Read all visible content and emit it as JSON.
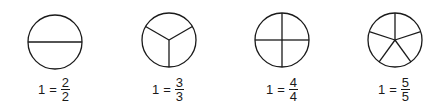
{
  "figures": [
    {
      "parts": 2,
      "cx": 55,
      "cy": 42,
      "r": 27,
      "label": {
        "whole": "1",
        "eq": "=",
        "num": "2",
        "den": "2"
      },
      "label_left": 38
    },
    {
      "parts": 3,
      "cx": 169,
      "cy": 40,
      "r": 27,
      "label": {
        "whole": "1",
        "eq": "=",
        "num": "3",
        "den": "3"
      },
      "label_left": 152
    },
    {
      "parts": 4,
      "cx": 282,
      "cy": 40,
      "r": 27,
      "label": {
        "whole": "1",
        "eq": "=",
        "num": "4",
        "den": "4"
      },
      "label_left": 266
    },
    {
      "parts": 5,
      "cx": 395,
      "cy": 40,
      "r": 27,
      "label": {
        "whole": "1",
        "eq": "=",
        "num": "5",
        "den": "5"
      },
      "label_left": 378
    }
  ],
  "colors": {
    "stroke": "#1a1a1a",
    "background": "#ffffff"
  }
}
